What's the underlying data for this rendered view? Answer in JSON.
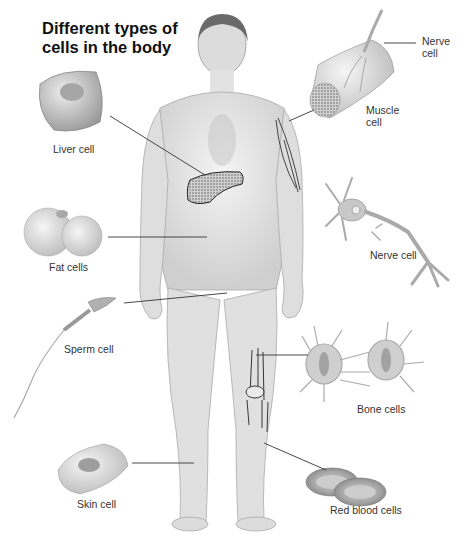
{
  "title": {
    "line1": "Different types of",
    "line2": "cells in the body"
  },
  "labels": {
    "liver": "Liver cell",
    "fat": "Fat cells",
    "sperm": "Sperm cell",
    "skin": "Skin cell",
    "nerve_top_line1": "Nerve",
    "nerve_top_line2": "cell",
    "muscle_line1": "Muscle",
    "muscle_line2": "cell",
    "nerve": "Nerve cell",
    "bone": "Bone cells",
    "red_blood": "Red blood cells"
  },
  "colors": {
    "background": "#ffffff",
    "title": "#111111",
    "label": "#333333",
    "leader_line": "#333333",
    "skin_fill": "#e6e6e6",
    "cell_gray": "#b8b8b8"
  }
}
